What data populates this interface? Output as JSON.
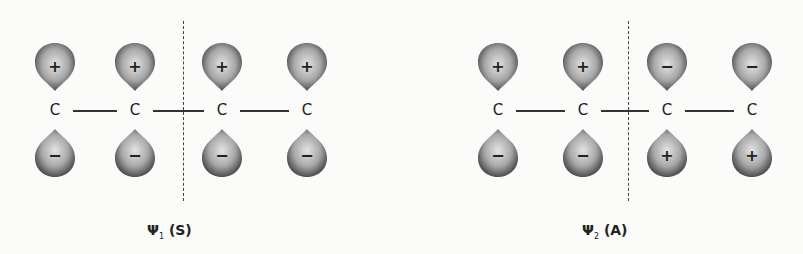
{
  "figure": "Pi molecular orbitals of butadiene showing symmetry with respect to a mirror plane",
  "panels": [
    {
      "id": "psi1",
      "label_symbol": "Ψ",
      "label_subscript": "1",
      "label_symmetry": "(S)",
      "symmetry": "symmetric",
      "atoms": [
        "C",
        "C",
        "C",
        "C"
      ],
      "upper_signs": [
        "+",
        "+",
        "+",
        "+"
      ],
      "lower_signs": [
        "−",
        "−",
        "−",
        "−"
      ]
    },
    {
      "id": "psi2",
      "label_symbol": "Ψ",
      "label_subscript": "2",
      "label_symmetry": "(A)",
      "symmetry": "antisymmetric",
      "atoms": [
        "C",
        "C",
        "C",
        "C"
      ],
      "upper_signs": [
        "+",
        "+",
        "−",
        "−"
      ],
      "lower_signs": [
        "−",
        "−",
        "+",
        "+"
      ]
    }
  ],
  "colors": {
    "lobe_dark": "#444444",
    "lobe_light": "#d8d8d8",
    "background": "#fbfbfa"
  }
}
